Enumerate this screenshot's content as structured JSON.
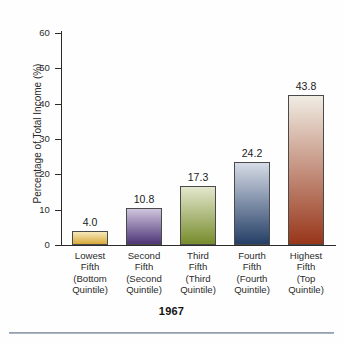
{
  "chart_data": {
    "type": "bar",
    "title": "1967",
    "xlabel": "",
    "ylabel": "Percentage of Total Income (%)",
    "ylim": [
      0,
      62
    ],
    "yticks": [
      0,
      10,
      20,
      30,
      40,
      50,
      60
    ],
    "ytick_labels": [
      "0",
      "10",
      "20",
      "30",
      "40",
      "50",
      "60"
    ],
    "grid": false,
    "legend": "none",
    "categories": [
      "Lowest Fifth (Bottom Quintile)",
      "Second Fifth (Second Quintile)",
      "Third Fifth (Third Quintile)",
      "Fourth Fifth (Fourth Quintile)",
      "Highest Fifth (Top Quintile)"
    ],
    "values": [
      4.0,
      10.8,
      17.3,
      24.2,
      43.8
    ],
    "value_labels": [
      "4.0",
      "10.8",
      "17.3",
      "24.2",
      "43.8"
    ],
    "bar_colors": [
      "#d8a93a",
      "#5a3f86",
      "#7f9433",
      "#2e4a72",
      "#a03c1c"
    ],
    "bars": [
      {
        "label_lines": [
          "Lowest",
          "Fifth",
          "(Bottom",
          "Quintile)"
        ],
        "value": 4.0,
        "value_label": "4.0",
        "color_top": "#f7e9bc",
        "color_bottom": "#d8a93a"
      },
      {
        "label_lines": [
          "Second",
          "Fifth",
          "(Second",
          "Quintile)"
        ],
        "value": 10.8,
        "value_label": "10.8",
        "color_top": "#cfc5de",
        "color_bottom": "#4e3576"
      },
      {
        "label_lines": [
          "Third",
          "Fifth",
          "(Third",
          "Quintile)"
        ],
        "value": 17.3,
        "value_label": "17.3",
        "color_top": "#e3e7cd",
        "color_bottom": "#778c2c"
      },
      {
        "label_lines": [
          "Fourth",
          "Fifth",
          "(Fourth",
          "Quintile)"
        ],
        "value": 24.2,
        "value_label": "24.2",
        "color_top": "#d6dbe6",
        "color_bottom": "#243f66"
      },
      {
        "label_lines": [
          "Highest",
          "Fifth",
          "(Top",
          "Quintile)"
        ],
        "value": 43.8,
        "value_label": "43.8",
        "color_top": "#f0ece3",
        "color_bottom": "#98361a"
      }
    ]
  },
  "axis": {
    "y_title": "Percentage of Total Income (%)",
    "tick_60": "60",
    "tick_50": "50",
    "tick_40": "40",
    "tick_30": "30",
    "tick_20": "20",
    "tick_10": "10",
    "tick_0": "0"
  },
  "footer": {
    "year": "1967"
  }
}
